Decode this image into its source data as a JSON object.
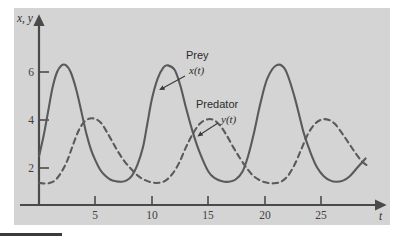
{
  "figure": {
    "background_color": "#d4d4d4",
    "page_color": "#ffffff",
    "curve_color": "#5a5a5a",
    "axis_color": "#4a4a4a"
  },
  "axes": {
    "y_axis_label": "x, y",
    "x_axis_label": "t",
    "x_ticks": [
      "5",
      "10",
      "15",
      "20",
      "25"
    ],
    "y_ticks": [
      "2",
      "4",
      "6"
    ]
  },
  "annotations": {
    "prey_label": "Prey",
    "prey_function": "x(t)",
    "predator_label": "Predator",
    "predator_function": "y(t)"
  },
  "chart_data": {
    "type": "line",
    "title": "",
    "subtitle": "",
    "xlabel": "t",
    "ylabel": "x, y",
    "xlim": [
      0,
      30
    ],
    "ylim": [
      0,
      7.4
    ],
    "xticks": [
      5,
      10,
      15,
      20,
      25
    ],
    "yticks": [
      2,
      4,
      6
    ],
    "grid": false,
    "legend": "inline-annotations",
    "period": 7.7,
    "series": [
      {
        "name": "Prey",
        "function": "x(t)",
        "style": "solid",
        "color": "#5a5a5a",
        "peak_value": 6.3,
        "trough_value": 1.05,
        "first_peak_t": 3.3,
        "x": [
          0.0,
          0.4,
          0.8,
          1.2,
          1.6,
          2.0,
          2.4,
          2.8,
          3.3,
          3.8,
          4.2,
          4.6,
          5.0,
          5.4,
          5.8,
          6.3,
          6.8,
          7.3,
          7.7,
          8.2,
          8.7,
          9.2,
          9.6,
          10.0,
          10.5,
          11.0,
          11.4,
          12.0,
          12.5,
          13.0,
          13.6,
          14.2,
          15.0,
          15.6,
          16.2,
          16.8,
          17.4,
          18.0,
          18.5,
          19.0,
          19.6,
          20.2,
          21.0,
          21.8,
          22.6,
          23.4,
          24.0,
          24.6,
          25.2,
          25.8,
          26.3,
          26.9,
          27.5,
          28.2,
          28.9
        ],
        "y": [
          2.2,
          3.1,
          4.2,
          5.3,
          6.0,
          6.3,
          6.3,
          6.0,
          5.2,
          4.1,
          3.2,
          2.5,
          2.0,
          1.6,
          1.35,
          1.15,
          1.07,
          1.05,
          1.1,
          1.3,
          1.8,
          2.6,
          3.7,
          4.8,
          5.7,
          6.2,
          6.3,
          6.1,
          5.4,
          4.4,
          3.3,
          2.4,
          1.5,
          1.2,
          1.07,
          1.05,
          1.15,
          1.5,
          2.2,
          3.2,
          4.6,
          5.7,
          6.3,
          6.1,
          4.9,
          3.3,
          2.4,
          1.7,
          1.3,
          1.1,
          1.05,
          1.1,
          1.3,
          1.7,
          2.1
        ]
      },
      {
        "name": "Predator",
        "function": "y(t)",
        "style": "dashed",
        "color": "#5a5a5a",
        "peak_value": 3.9,
        "trough_value": 0.95,
        "first_peak_t": 5.0,
        "x": [
          0.0,
          0.5,
          1.0,
          1.5,
          2.0,
          2.5,
          3.0,
          3.5,
          4.0,
          4.5,
          5.0,
          5.5,
          6.0,
          6.5,
          7.0,
          7.6,
          8.2,
          8.8,
          9.4,
          10.0,
          10.6,
          11.2,
          11.8,
          12.4,
          13.0,
          13.6,
          14.2,
          14.8,
          15.4,
          16.0,
          16.6,
          17.2,
          17.8,
          18.4,
          19.0,
          19.6,
          20.2,
          20.8,
          21.4,
          22.0,
          22.6,
          23.2,
          23.8,
          24.4,
          25.0,
          25.6,
          26.2,
          26.8,
          27.4,
          28.0,
          28.6,
          29.0
        ],
        "y": [
          1.0,
          0.97,
          1.0,
          1.15,
          1.5,
          2.0,
          2.7,
          3.35,
          3.75,
          3.9,
          3.88,
          3.7,
          3.3,
          2.85,
          2.4,
          1.95,
          1.6,
          1.3,
          1.12,
          1.02,
          1.0,
          1.1,
          1.4,
          1.9,
          2.6,
          3.2,
          3.65,
          3.85,
          3.85,
          3.6,
          3.15,
          2.6,
          2.1,
          1.65,
          1.3,
          1.1,
          1.0,
          0.98,
          1.05,
          1.3,
          1.8,
          2.5,
          3.2,
          3.65,
          3.85,
          3.85,
          3.65,
          3.25,
          2.8,
          2.35,
          1.95,
          1.8
        ]
      }
    ]
  }
}
